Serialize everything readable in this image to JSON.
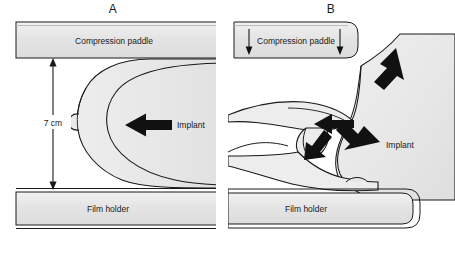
{
  "figure": {
    "type": "medical-illustration",
    "background_color": "#ffffff",
    "line_color": "#1a1a1a",
    "fill_tissue": "#e8e8e8",
    "fill_hardware": "#e2e2e2",
    "arrow_color": "#111111"
  },
  "panels": [
    {
      "id": "A",
      "label": "A",
      "caption": "Implant in place, standard compression",
      "hardware": {
        "paddle_label": "Compression paddle",
        "film_label": "Film holder"
      },
      "measurement": {
        "value": "7 cm",
        "description": "distance between compression paddle and film holder"
      },
      "annotations": [
        {
          "label": "Implant",
          "arrow": "left"
        }
      ]
    },
    {
      "id": "B",
      "label": "B",
      "caption": "Implant displaced posteriorly, tissue pulled forward",
      "hardware": {
        "paddle_label": "Compression paddle",
        "film_label": "Film holder"
      },
      "annotations": [
        {
          "label": "Implant",
          "arrow": "none"
        }
      ],
      "force_arrows": [
        {
          "name": "paddle-down-left",
          "direction": "down"
        },
        {
          "name": "paddle-down-right",
          "direction": "down"
        },
        {
          "name": "implant-up-right",
          "direction": "up-right"
        },
        {
          "name": "implant-down-right",
          "direction": "down-right"
        },
        {
          "name": "tissue-pull-left",
          "direction": "left"
        },
        {
          "name": "tissue-pull-upleft",
          "direction": "up-left"
        }
      ]
    }
  ],
  "labels": {
    "compression_paddle": "Compression paddle",
    "film_holder": "Film holder",
    "implant": "Implant",
    "measurement": "7 cm",
    "panel_a": "A",
    "panel_b": "B"
  }
}
